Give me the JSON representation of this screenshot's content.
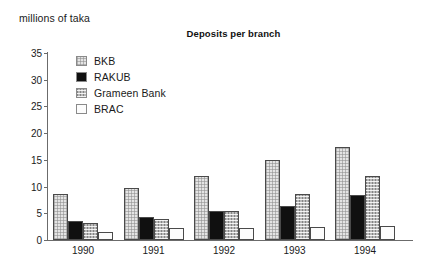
{
  "chart_data": {
    "type": "bar",
    "title": "Deposits per branch",
    "ylabel": "millions of taka",
    "xlabel": "",
    "categories": [
      "1990",
      "1991",
      "1992",
      "1993",
      "1994"
    ],
    "ylim": [
      0,
      35
    ],
    "yticks": [
      0,
      5,
      10,
      15,
      20,
      25,
      30,
      35
    ],
    "ytick_labels": [
      "0",
      "5",
      "10",
      "15",
      "20",
      "25",
      "30",
      "35"
    ],
    "grid": false,
    "legend_position": "upper-left-inside",
    "series": [
      {
        "name": "BKB",
        "swatch": "light-gray-dotted",
        "color": "#e4e4e4",
        "values": [
          8.6,
          9.8,
          12.0,
          15.0,
          17.5
        ]
      },
      {
        "name": "RAKUB",
        "swatch": "solid-black",
        "color": "#101010",
        "values": [
          3.6,
          4.3,
          5.5,
          6.3,
          8.5
        ]
      },
      {
        "name": "Grameen Bank",
        "swatch": "medium-gray-checked",
        "color": "#b9b9b9",
        "values": [
          3.1,
          4.0,
          5.4,
          8.7,
          12.0
        ]
      },
      {
        "name": "BRAC",
        "swatch": "white-empty",
        "color": "#fcfcfc",
        "values": [
          1.5,
          2.2,
          2.2,
          2.5,
          2.7
        ]
      }
    ]
  }
}
